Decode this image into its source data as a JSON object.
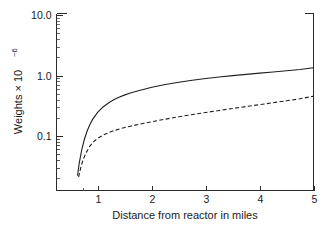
{
  "chart_data": {
    "type": "line",
    "title": "",
    "xlabel": "Distance from reactor in miles",
    "ylabel": "Weights × 10",
    "ylabel_exponent": "−6",
    "xlim": [
      0.22,
      5.0
    ],
    "ylim": [
      0.02,
      10.0
    ],
    "yscale": "log",
    "xscale": "linear",
    "grid": false,
    "legend": null,
    "xticks": [
      1,
      2,
      3,
      4,
      5
    ],
    "xtick_labels": [
      "1",
      "2",
      "3",
      "4",
      "5"
    ],
    "yticks": [
      0.1,
      1.0,
      10.0
    ],
    "ytick_labels": [
      "0.1",
      "1.0",
      "10.0"
    ],
    "yminor_ticks": [
      0.03,
      0.04,
      0.05,
      0.06,
      0.07,
      0.08,
      0.09,
      0.2,
      0.3,
      0.4,
      0.5,
      0.6,
      0.7,
      0.8,
      0.9,
      2,
      3,
      4,
      5,
      6,
      7,
      8,
      9
    ],
    "series": [
      {
        "name": "solid-curve",
        "style": "solid",
        "color": "#1f1f1f",
        "x": [
          0.62,
          0.65,
          0.7,
          0.75,
          0.8,
          0.85,
          0.9,
          1.0,
          1.1,
          1.2,
          1.3,
          1.4,
          1.5,
          1.6,
          1.75,
          2.0,
          2.25,
          2.5,
          2.75,
          3.0,
          3.25,
          3.5,
          3.75,
          4.0,
          4.25,
          4.5,
          4.75,
          5.0
        ],
        "y": [
          0.022,
          0.035,
          0.06,
          0.09,
          0.122,
          0.155,
          0.188,
          0.25,
          0.305,
          0.355,
          0.4,
          0.44,
          0.478,
          0.512,
          0.56,
          0.64,
          0.71,
          0.775,
          0.835,
          0.89,
          0.945,
          0.995,
          1.045,
          1.095,
          1.145,
          1.195,
          1.255,
          1.34
        ]
      },
      {
        "name": "dashed-curve",
        "style": "dashed",
        "color": "#1f1f1f",
        "x": [
          0.64,
          0.68,
          0.72,
          0.78,
          0.85,
          0.92,
          1.0,
          1.1,
          1.2,
          1.3,
          1.4,
          1.5,
          1.6,
          1.75,
          2.0,
          2.25,
          2.5,
          2.75,
          3.0,
          3.25,
          3.5,
          3.75,
          4.0,
          4.25,
          4.5,
          4.75,
          5.0
        ],
        "y": [
          0.021,
          0.03,
          0.04,
          0.053,
          0.068,
          0.081,
          0.092,
          0.104,
          0.114,
          0.123,
          0.131,
          0.138,
          0.145,
          0.155,
          0.172,
          0.19,
          0.208,
          0.226,
          0.245,
          0.264,
          0.285,
          0.307,
          0.33,
          0.355,
          0.382,
          0.412,
          0.455
        ]
      }
    ]
  }
}
